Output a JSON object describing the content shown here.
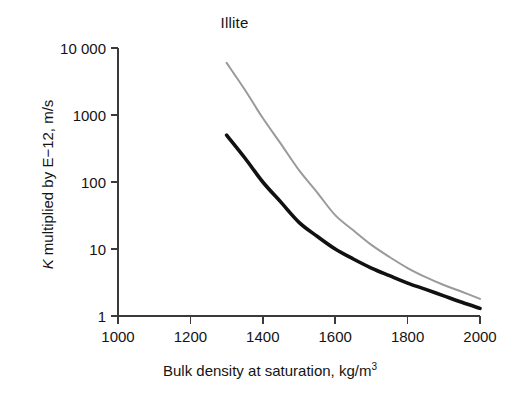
{
  "chart_data": {
    "type": "line",
    "title": "Illite",
    "xlabel": "Bulk density at saturation, kg/m",
    "xlabel_exponent": "3",
    "ylabel_prefix": "K",
    "ylabel_rest": " multiplied by E−12, m/s",
    "ylabel_full": "K multiplied by E−12, m/s",
    "xlim": [
      1000,
      2000
    ],
    "ylim": [
      1,
      10000
    ],
    "yscale": "log",
    "xscale": "linear",
    "grid": false,
    "legend": "none",
    "xticks": [
      1000,
      1200,
      1400,
      1600,
      1800,
      2000
    ],
    "xticklabels": [
      "1000",
      "1200",
      "1400",
      "1600",
      "1800",
      "2000"
    ],
    "yticks": [
      1,
      10,
      100,
      1000,
      10000
    ],
    "yticklabels": [
      "1",
      "10",
      "100",
      "1000",
      "10 000"
    ],
    "x": [
      1300,
      1350,
      1400,
      1450,
      1500,
      1550,
      1600,
      1650,
      1700,
      1750,
      1800,
      1850,
      1900,
      1950,
      2000
    ],
    "series": [
      {
        "name": "upper-curve",
        "color": "#9a9a9a",
        "width": 2.0,
        "values": [
          6000,
          2400,
          900,
          370,
          150,
          70,
          32,
          19,
          11.5,
          7.6,
          5.2,
          3.8,
          2.9,
          2.3,
          1.8
        ]
      },
      {
        "name": "lower-curve",
        "color": "#111111",
        "width": 3.6,
        "values": [
          500,
          230,
          100,
          50,
          25,
          15.5,
          10.0,
          7.1,
          5.2,
          4.0,
          3.1,
          2.5,
          2.0,
          1.6,
          1.3
        ]
      }
    ],
    "axis_color": "#3a3a3a"
  }
}
